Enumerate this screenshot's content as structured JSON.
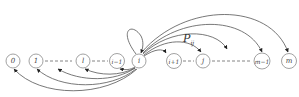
{
  "diagram": {
    "type": "state-transition",
    "nodes": [
      {
        "id": "0",
        "label": "0",
        "cx": 13,
        "cy": 61
      },
      {
        "id": "1",
        "label": "1",
        "cx": 36,
        "cy": 61
      },
      {
        "id": "l",
        "label": "l",
        "cx": 83,
        "cy": 61
      },
      {
        "id": "i-1",
        "label": "i−1",
        "cx": 117,
        "cy": 61
      },
      {
        "id": "i",
        "label": "i",
        "cx": 139,
        "cy": 61
      },
      {
        "id": "i+1",
        "label": "i+1",
        "cx": 174,
        "cy": 61
      },
      {
        "id": "j",
        "label": "j",
        "cx": 203,
        "cy": 61
      },
      {
        "id": "m-1",
        "label": "m−1",
        "cx": 262,
        "cy": 61
      },
      {
        "id": "m",
        "label": "m",
        "cx": 289,
        "cy": 61
      }
    ],
    "edge_label": {
      "main": "P",
      "sub": "ij"
    },
    "edges_from": "i",
    "edges_to": [
      "i",
      "i-1",
      "l",
      "ellipsis-left",
      "1",
      "0",
      "i+1",
      "j",
      "ellipsis-right",
      "m-1",
      "m"
    ]
  }
}
